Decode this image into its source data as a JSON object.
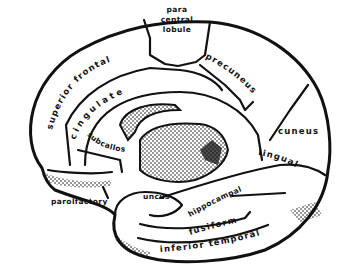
{
  "diagram": {
    "labels": {
      "para_central_1": "para",
      "para_central_2": "central",
      "para_central_3": "lobule",
      "superior_frontal": "superior frontal",
      "cingulate": "cingulate",
      "precuneus": "precuneus",
      "cuneus": "cuneus",
      "subcallosal": "subcallosal",
      "lingual": "lingual",
      "uncus": "uncus",
      "hippocampal": "hippocampal",
      "parolfactory": "parolfactory",
      "fusiform": "fusiform",
      "inferior_temporal": "inferior temporal"
    },
    "colors": {
      "ink": "#111111",
      "background": "#ffffff"
    }
  }
}
